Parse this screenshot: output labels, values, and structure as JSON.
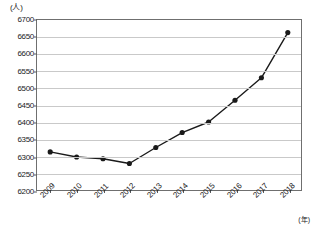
{
  "axes": {
    "y_unit_label": "(人)",
    "x_unit_label": "(年)",
    "y_ticks": [
      6200,
      6250,
      6300,
      6350,
      6400,
      6450,
      6500,
      6550,
      6600,
      6650,
      6700
    ],
    "x_ticks": [
      "2009",
      "2010",
      "2011",
      "2012",
      "2013",
      "2014",
      "2015",
      "2016",
      "2017",
      "2018"
    ]
  },
  "style": {
    "line_color": "#1a1a1a",
    "marker_color": "#1a1a1a",
    "grid_color": "#c9c9c9",
    "frame_color": "#6f6f6f",
    "background": "#ffffff"
  },
  "chart_data": {
    "type": "line",
    "title": "",
    "xlabel": "(年)",
    "ylabel": "(人)",
    "x": [
      "2009",
      "2010",
      "2011",
      "2012",
      "2013",
      "2014",
      "2015",
      "2016",
      "2017",
      "2018"
    ],
    "values": [
      6312,
      6297,
      6292,
      6278,
      6325,
      6369,
      6400,
      6464,
      6530,
      6663
    ],
    "ylim": [
      6200,
      6700
    ],
    "ytick_step": 50,
    "grid": "horizontal",
    "legend": "none",
    "markers": "filled-circle"
  }
}
